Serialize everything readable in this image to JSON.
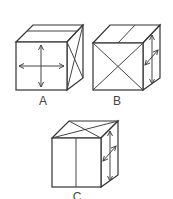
{
  "figure": {
    "cubes": [
      {
        "label": "A",
        "front_face": "horizontal and vertical double-headed arrows crossing at center",
        "top_face": "one line parallel to front edge",
        "right_face": "X (both diagonals)"
      },
      {
        "label": "B",
        "front_face": "X (both diagonals)",
        "top_face": "line from midpoint of front edge to midpoint of back edge",
        "right_face": "vertical double-headed arrow and diagonal double-headed arrow"
      },
      {
        "label": "C",
        "front_face": "vertical line through center",
        "top_face": "X (both diagonals)",
        "right_face": "vertical double-headed arrow and diagonal double-headed arrow"
      }
    ]
  },
  "colors": {
    "line": "#333333",
    "background": "#ffffff"
  }
}
